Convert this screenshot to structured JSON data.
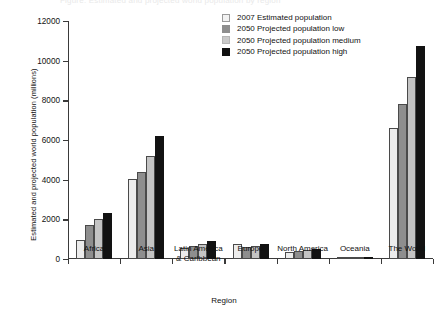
{
  "figure": {
    "clipped_header": "Figure: Estimated and projected world population by region",
    "xlabel": "Region",
    "ylabel": "Estimated and projected world population (millions)"
  },
  "legend": {
    "items": [
      {
        "label": "2007 Estimated population",
        "color": "#f2f2f2",
        "icon": "legend-swatch-icon"
      },
      {
        "label": "2050 Projected population low",
        "color": "#8e8e8e",
        "icon": "legend-swatch-icon"
      },
      {
        "label": "2050 Projected population medium",
        "color": "#c9c9c9",
        "icon": "legend-swatch-icon"
      },
      {
        "label": "2050 Projected population high",
        "color": "#101010",
        "icon": "legend-swatch-icon"
      }
    ]
  },
  "chart_data": {
    "type": "bar",
    "title": "",
    "xlabel": "Region",
    "ylabel": "Estimated and projected world population (millions)",
    "ylim": [
      0,
      12000
    ],
    "yticks": [
      0,
      2000,
      4000,
      6000,
      8000,
      10000,
      12000
    ],
    "ytick_labels": [
      "0",
      "2000",
      "4000",
      "6000",
      "8000",
      "10000",
      "12000"
    ],
    "grid": false,
    "legend_position": "top-right",
    "categories": [
      "Africa",
      "Asia",
      "Latin America\n& Caribbean",
      "Europe",
      "North America",
      "Oceania",
      "The World"
    ],
    "series": [
      {
        "name": "2007 Estimated population",
        "color": "#f2f2f2",
        "values": [
          965,
          4030,
          569,
          733,
          335,
          34,
          6600
        ]
      },
      {
        "name": "2050 Projected population low",
        "color": "#8e8e8e",
        "values": [
          1700,
          4400,
          650,
          620,
          420,
          40,
          7800
        ]
      },
      {
        "name": "2050 Projected population medium",
        "color": "#c9c9c9",
        "values": [
          2000,
          5200,
          770,
          660,
          460,
          45,
          9200
        ]
      },
      {
        "name": "2050 Projected population high",
        "color": "#101010",
        "values": [
          2300,
          6200,
          900,
          760,
          530,
          55,
          10750
        ]
      }
    ]
  }
}
